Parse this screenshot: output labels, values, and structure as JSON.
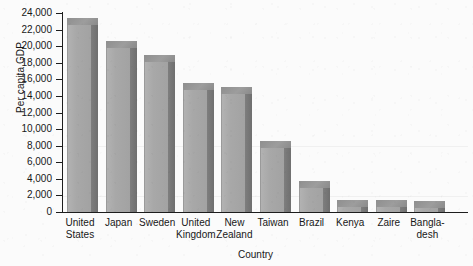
{
  "chart_data": {
    "type": "bar",
    "title": "",
    "xlabel": "Country",
    "ylabel": "Per capita GDP",
    "ylim": [
      0,
      24000
    ],
    "ytick_step": 2000,
    "grid": false,
    "legend": false,
    "style_3d": true,
    "categories": [
      "United States",
      "Japan",
      "Sweden",
      "United Kingdom",
      "New Zealand",
      "Taiwan",
      "Brazil",
      "Kenya",
      "Zaire",
      "Bangladesh"
    ],
    "category_lines": [
      [
        "United",
        "States"
      ],
      [
        "Japan",
        ""
      ],
      [
        "Sweden",
        ""
      ],
      [
        "United",
        "Kingdom"
      ],
      [
        "New",
        "Zealand"
      ],
      [
        "Taiwan",
        ""
      ],
      [
        "Brazil",
        ""
      ],
      [
        "Kenya",
        ""
      ],
      [
        "Zaire",
        ""
      ],
      [
        "Bangla-",
        "desh"
      ]
    ],
    "values": [
      22500,
      19800,
      18100,
      14700,
      14200,
      7700,
      2900,
      600,
      550,
      450
    ],
    "ytick_labels": [
      "24,000",
      "22,000",
      "20,000",
      "18,000",
      "16,000",
      "14,000",
      "12,000",
      "10,000",
      "8,000",
      "6,000",
      "4,000",
      "2,000",
      "0"
    ],
    "ytick_values": [
      24000,
      22000,
      20000,
      18000,
      16000,
      14000,
      12000,
      10000,
      8000,
      6000,
      4000,
      2000,
      0
    ],
    "colors": {
      "bar_front": "#a8a8a8",
      "bar_side": "#767676",
      "bar_top": "#949494",
      "axis": "#1d1d1d",
      "background": "#fbfbfb",
      "text": "#181818"
    }
  }
}
